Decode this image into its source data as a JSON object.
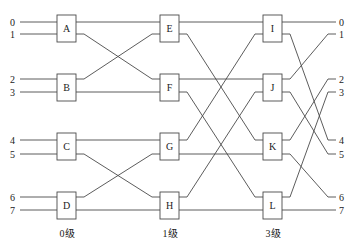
{
  "diagram": {
    "type": "butterfly-network",
    "inputs": [
      "0",
      "1",
      "2",
      "3",
      "4",
      "5",
      "6",
      "7"
    ],
    "outputs": [
      "0",
      "1",
      "2",
      "3",
      "4",
      "5",
      "6",
      "7"
    ],
    "stages": [
      {
        "label": "0级",
        "switches": [
          "A",
          "B",
          "C",
          "D"
        ]
      },
      {
        "label": "1级",
        "switches": [
          "E",
          "F",
          "G",
          "H"
        ]
      },
      {
        "label": "3级",
        "switches": [
          "I",
          "J",
          "K",
          "L"
        ]
      }
    ],
    "connections": [
      {
        "from": "A.out0",
        "to": "E.in0"
      },
      {
        "from": "A.out1",
        "to": "F.in0"
      },
      {
        "from": "B.out0",
        "to": "E.in1"
      },
      {
        "from": "B.out1",
        "to": "F.in1"
      },
      {
        "from": "C.out0",
        "to": "G.in0"
      },
      {
        "from": "C.out1",
        "to": "H.in0"
      },
      {
        "from": "D.out0",
        "to": "G.in1"
      },
      {
        "from": "D.out1",
        "to": "H.in1"
      },
      {
        "from": "E.out0",
        "to": "I.in0"
      },
      {
        "from": "E.out1",
        "to": "K.in0"
      },
      {
        "from": "F.out0",
        "to": "J.in0"
      },
      {
        "from": "F.out1",
        "to": "L.in0"
      },
      {
        "from": "G.out0",
        "to": "I.in1"
      },
      {
        "from": "G.out1",
        "to": "K.in1"
      },
      {
        "from": "H.out0",
        "to": "J.in1"
      },
      {
        "from": "H.out1",
        "to": "L.in1"
      },
      {
        "from": "I.out0",
        "to": "out 0"
      },
      {
        "from": "I.out1",
        "to": "out 4"
      },
      {
        "from": "J.out0",
        "to": "out 1"
      },
      {
        "from": "J.out1",
        "to": "out 5"
      },
      {
        "from": "K.out0",
        "to": "out 2"
      },
      {
        "from": "K.out1",
        "to": "out 6"
      },
      {
        "from": "L.out0",
        "to": "out 3"
      },
      {
        "from": "L.out1",
        "to": "out 7"
      }
    ],
    "colors": {
      "line": "#4a4a4a",
      "text": "#222222",
      "background": "#ffffff"
    }
  }
}
